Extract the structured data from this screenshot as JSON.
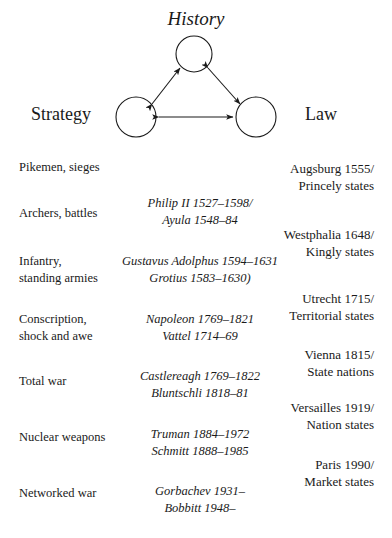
{
  "diagram": {
    "nodes": [
      {
        "id": "history",
        "label": "History",
        "cx": 194,
        "cy": 54,
        "r": 18
      },
      {
        "id": "strategy",
        "label": "Strategy",
        "cx": 136,
        "cy": 117,
        "r": 20
      },
      {
        "id": "law",
        "label": "Law",
        "cx": 256,
        "cy": 117,
        "r": 20
      }
    ],
    "edges": [
      {
        "from": "strategy",
        "to": "history",
        "double_headed": true
      },
      {
        "from": "history",
        "to": "law",
        "double_headed": true
      },
      {
        "from": "strategy",
        "to": "law",
        "double_headed": true
      }
    ],
    "stroke_color": "#1a1a1a"
  },
  "matrix": {
    "strategy_column": [
      {
        "lines": [
          "Pikemen, sieges"
        ],
        "top": 9
      },
      {
        "lines": [
          "Archers, battles"
        ],
        "top": 55
      },
      {
        "lines": [
          "Infantry,",
          "standing armies"
        ],
        "top": 103
      },
      {
        "lines": [
          "Conscription,",
          "shock and awe"
        ],
        "top": 161
      },
      {
        "lines": [
          "Total war"
        ],
        "top": 223
      },
      {
        "lines": [
          "Nuclear weapons"
        ],
        "top": 279
      },
      {
        "lines": [
          "Networked war"
        ],
        "top": 335
      }
    ],
    "history_column": [
      {
        "lines": [
          "Philip II 1527–1598/",
          "Ayula 1548–84"
        ],
        "top": 45
      },
      {
        "lines": [
          "Gustavus Adolphus 1594–1631",
          "Grotius 1583–1630)"
        ],
        "top": 103
      },
      {
        "lines": [
          "Napoleon 1769–1821",
          "Vattel 1714–69"
        ],
        "top": 161
      },
      {
        "lines": [
          "Castlereagh 1769–1822",
          "Bluntschli 1818–81"
        ],
        "top": 218
      },
      {
        "lines": [
          "Truman 1884–1972",
          "Schmitt 1888–1985"
        ],
        "top": 276
      },
      {
        "lines": [
          "Gorbachev 1931–",
          "Bobbitt 1948–"
        ],
        "top": 333
      }
    ],
    "law_column": [
      {
        "lines": [
          "Augsburg 1555/",
          "Princely states"
        ],
        "top": 10
      },
      {
        "lines": [
          "Westphalia 1648/",
          "Kingly states"
        ],
        "top": 76
      },
      {
        "lines": [
          "Utrecht 1715/",
          "Territorial states"
        ],
        "top": 140
      },
      {
        "lines": [
          "Vienna 1815/",
          "State nations"
        ],
        "top": 196
      },
      {
        "lines": [
          "Versailles 1919/",
          "Nation states"
        ],
        "top": 249
      },
      {
        "lines": [
          "Paris 1990/",
          "Market states"
        ],
        "top": 306
      }
    ]
  }
}
